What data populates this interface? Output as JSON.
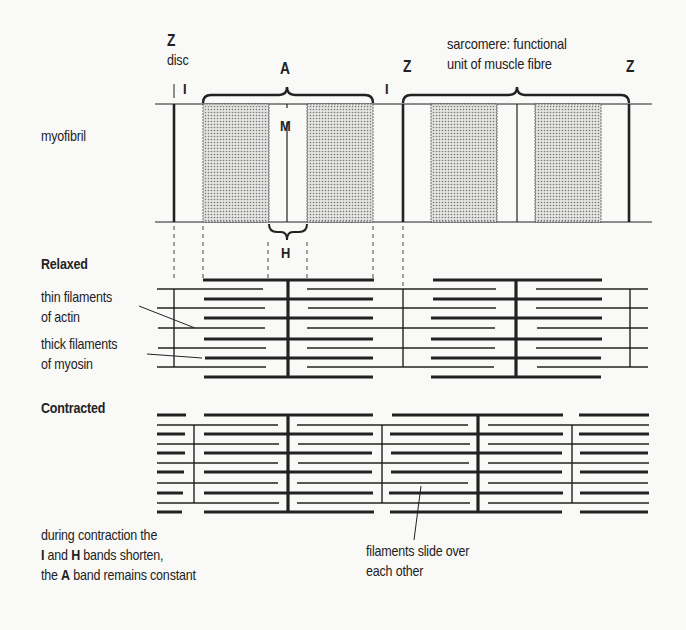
{
  "figure": {
    "myofibril": {
      "label": "myofibril",
      "z_label": "Z",
      "z_disc_label": "disc",
      "i_label": "I",
      "a_label": "A",
      "m_label": "M",
      "h_label": "H",
      "z_label_2": "Z",
      "i_label_2": "I",
      "z_label_3": "Z",
      "sarcomere_line1": "sarcomere: functional",
      "sarcomere_line2": "unit of muscle fibre"
    },
    "relaxed": {
      "heading": "Relaxed",
      "thin_line1": "thin filaments",
      "thin_line2": "of actin",
      "thick_line1": "thick filaments",
      "thick_line2": "of myosin"
    },
    "contracted": {
      "heading": "Contracted",
      "note_line1": "during contraction the",
      "note_line2_i": "I",
      "note_line2_and": " and ",
      "note_line2_h": "H",
      "note_line2_rest": " bands shorten,",
      "note_line3_the": "the ",
      "note_line3_a": "A",
      "note_line3_rest": " band remains constant",
      "slide_line1": "filaments slide over",
      "slide_line2": "each other"
    },
    "colors": {
      "ink": "#222222",
      "background": "#f9f9f8",
      "stipple": "#9a9a9a"
    }
  }
}
